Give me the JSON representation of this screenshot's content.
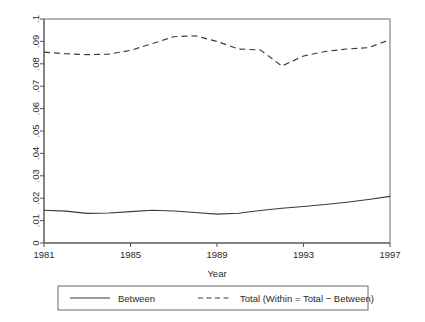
{
  "chart_data": {
    "type": "line",
    "title": "",
    "xlabel": "Year",
    "ylabel": "",
    "xlim": [
      1981,
      1997
    ],
    "ylim": [
      0,
      0.1
    ],
    "grid": false,
    "legend_position": "bottom",
    "x": [
      1981,
      1982,
      1983,
      1984,
      1985,
      1986,
      1987,
      1988,
      1989,
      1990,
      1991,
      1992,
      1993,
      1994,
      1995,
      1996,
      1997
    ],
    "xticks": [
      1981,
      1985,
      1989,
      1993,
      1997
    ],
    "xtick_labels": [
      "1981",
      "1985",
      "1989",
      "1993",
      "1997"
    ],
    "yticks": [
      0,
      0.01,
      0.02,
      0.03,
      0.04,
      0.05,
      0.06,
      0.07,
      0.08,
      0.09,
      0.1
    ],
    "ytick_labels": [
      "0",
      ".01",
      ".02",
      ".03",
      ".04",
      ".05",
      ".06",
      ".07",
      ".08",
      ".09",
      ".1"
    ],
    "series": [
      {
        "name": "Between",
        "style": "solid",
        "color": "#3a3a3a",
        "values": [
          0.0146,
          0.0142,
          0.0132,
          0.0134,
          0.014,
          0.0146,
          0.0143,
          0.0136,
          0.0129,
          0.0133,
          0.0145,
          0.0155,
          0.0163,
          0.0172,
          0.0182,
          0.0194,
          0.0208
        ]
      },
      {
        "name": "Total (Within = Total − Between)",
        "style": "dashed",
        "color": "#3a3a3a",
        "values": [
          0.0852,
          0.0845,
          0.0841,
          0.0843,
          0.086,
          0.089,
          0.0921,
          0.0925,
          0.09,
          0.0866,
          0.0862,
          0.079,
          0.0835,
          0.0855,
          0.0866,
          0.0872,
          0.0908
        ]
      }
    ]
  },
  "legend": {
    "entries": [
      {
        "label": "Between",
        "style": "solid"
      },
      {
        "label": "Total (Within = Total − Between)",
        "style": "dashed"
      }
    ]
  }
}
